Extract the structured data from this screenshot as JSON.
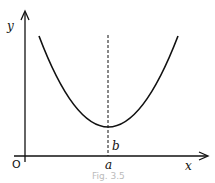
{
  "diagram": {
    "y_axis_label": "y",
    "x_axis_label": "x",
    "origin_label": "O",
    "vertex_x_label": "a",
    "vertex_y_label": "b",
    "caption": "Fig. 3.5",
    "curve": "parabola (U-shaped) with minimum at (a, b)",
    "line_color": "#111111"
  }
}
